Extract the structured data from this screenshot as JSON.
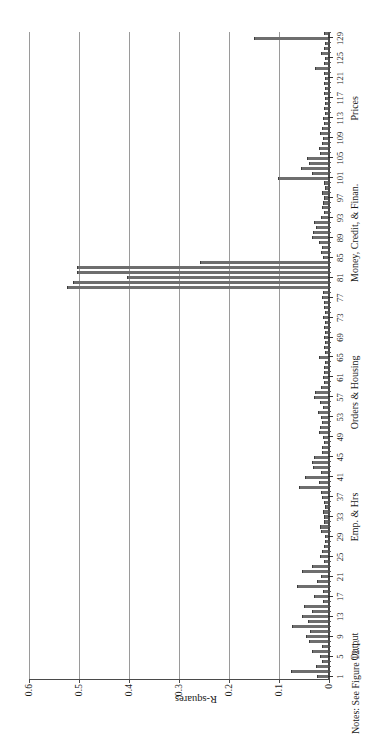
{
  "figure": {
    "note": "Notes: See Figure 12.1.",
    "orientation": "rotated-90-ccw",
    "colors": {
      "bar_fill": "#6e6e6e",
      "bar_edge": "#3c3c3c",
      "axis": "#4a4a4a",
      "gridline": "#9a9a9a",
      "background": "#ffffff"
    }
  },
  "chart_data": {
    "type": "bar",
    "title": "",
    "subtitle": "",
    "xlabel": "",
    "ylabel": "R-squares",
    "ylim": [
      0,
      0.6
    ],
    "ytick_labels": [
      "0",
      "0.1",
      "0.2",
      "0.3",
      "0.4",
      "0.5",
      "0.6"
    ],
    "ytick_values": [
      0,
      0.1,
      0.2,
      0.3,
      0.4,
      0.5,
      0.6
    ],
    "grid": "horizontal-value-lines",
    "legend": "none",
    "xtick_labels": [
      "1",
      "5",
      "9",
      "13",
      "17",
      "21",
      "25",
      "29",
      "33",
      "37",
      "41",
      "45",
      "49",
      "53",
      "57",
      "61",
      "65",
      "69",
      "73",
      "77",
      "81",
      "85",
      "89",
      "93",
      "97",
      "101",
      "105",
      "109",
      "113",
      "117",
      "121",
      "125",
      "129"
    ],
    "xtick_values": [
      1,
      5,
      9,
      13,
      17,
      21,
      25,
      29,
      33,
      37,
      41,
      45,
      49,
      53,
      57,
      61,
      65,
      69,
      73,
      77,
      81,
      85,
      89,
      93,
      97,
      101,
      105,
      109,
      113,
      117,
      121,
      125,
      129
    ],
    "group_labels": [
      {
        "label": "Output",
        "center": 7
      },
      {
        "label": "Emp. & Hrs",
        "center": 33
      },
      {
        "label": "Orders & Housing",
        "center": 58
      },
      {
        "label": "Money, Credit, & Finan.",
        "center": 90
      },
      {
        "label": "Prices",
        "center": 115
      }
    ],
    "categories": [
      1,
      2,
      3,
      4,
      5,
      6,
      7,
      8,
      9,
      10,
      11,
      12,
      13,
      14,
      15,
      16,
      17,
      18,
      19,
      20,
      21,
      22,
      23,
      24,
      25,
      26,
      27,
      28,
      29,
      30,
      31,
      32,
      33,
      34,
      35,
      36,
      37,
      38,
      39,
      40,
      41,
      42,
      43,
      44,
      45,
      46,
      47,
      48,
      49,
      50,
      51,
      52,
      53,
      54,
      55,
      56,
      57,
      58,
      59,
      60,
      61,
      62,
      63,
      64,
      65,
      66,
      67,
      68,
      69,
      70,
      71,
      72,
      73,
      74,
      75,
      76,
      77,
      78,
      79,
      80,
      81,
      82,
      83,
      84,
      85,
      86,
      87,
      88,
      89,
      90,
      91,
      92,
      93,
      94,
      95,
      96,
      97,
      98,
      99,
      100,
      101,
      102,
      103,
      104,
      105,
      106,
      107,
      108,
      109,
      110,
      111,
      112,
      113,
      114,
      115,
      116,
      117,
      118,
      119,
      120,
      121,
      122,
      123,
      124,
      125,
      126,
      127,
      128,
      129,
      130
    ],
    "values": [
      0.02,
      0.072,
      0.022,
      0.01,
      0.014,
      0.03,
      0.01,
      0.036,
      0.042,
      0.034,
      0.07,
      0.038,
      0.05,
      0.03,
      0.046,
      0.008,
      0.026,
      0.008,
      0.06,
      0.02,
      0.012,
      0.05,
      0.03,
      0.006,
      0.014,
      0.01,
      0.006,
      0.004,
      0.004,
      0.012,
      0.014,
      0.006,
      0.006,
      0.008,
      0.004,
      0.006,
      0.01,
      0.012,
      0.056,
      0.016,
      0.044,
      0.012,
      0.028,
      0.03,
      0.026,
      0.01,
      0.01,
      0.006,
      0.008,
      0.016,
      0.014,
      0.01,
      0.012,
      0.018,
      0.008,
      0.014,
      0.026,
      0.024,
      0.012,
      0.006,
      0.008,
      0.006,
      0.006,
      0.004,
      0.016,
      0.004,
      0.006,
      0.004,
      0.006,
      0.004,
      0.006,
      0.004,
      0.008,
      0.004,
      0.006,
      0.006,
      0.01,
      0.008,
      0.52,
      0.508,
      0.4,
      0.5,
      0.5,
      0.254,
      0.008,
      0.012,
      0.01,
      0.016,
      0.03,
      0.028,
      0.022,
      0.026,
      0.012,
      0.006,
      0.01,
      0.008,
      0.006,
      0.01,
      0.004,
      0.006,
      0.098,
      0.03,
      0.052,
      0.036,
      0.04,
      0.014,
      0.016,
      0.01,
      0.008,
      0.014,
      0.01,
      0.006,
      0.008,
      0.004,
      0.006,
      0.004,
      0.004,
      0.006,
      0.004,
      0.006,
      0.004,
      0.006,
      0.024,
      0.006,
      0.004,
      0.012,
      0.006,
      0.004,
      0.146,
      0.006
    ]
  }
}
